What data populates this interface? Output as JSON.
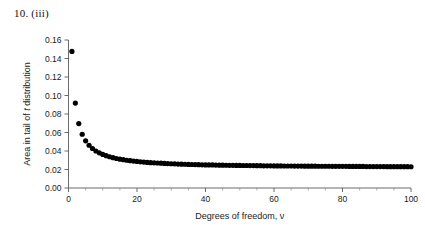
{
  "figure": {
    "label": "10. (iii)",
    "background_color": "#ffffff",
    "marker_color": "#000000",
    "axis_color": "#5a5a5a"
  },
  "chart_data": {
    "type": "scatter",
    "title": "10. (iii)",
    "xlabel_prefix": "Degrees of freedom, ",
    "xlabel_symbol": "ν",
    "xlabel": "Degrees of freedom, ν",
    "ylabel_prefix": "Area in tail of ",
    "ylabel_symbol": "t",
    "ylabel_suffix": " distribution",
    "ylabel": "Area in tail of t distribution",
    "xlim": [
      0,
      100
    ],
    "ylim": [
      0.0,
      0.16
    ],
    "x_major_ticks": [
      0,
      20,
      40,
      60,
      80,
      100
    ],
    "x_tick_labels": [
      "0",
      "20",
      "40",
      "60",
      "80",
      "100"
    ],
    "x_minor_step": 5,
    "y_major_ticks": [
      0.0,
      0.02,
      0.04,
      0.06,
      0.08,
      0.1,
      0.12,
      0.14,
      0.16
    ],
    "y_tick_labels": [
      "0.00",
      "0.02",
      "0.04",
      "0.06",
      "0.08",
      "0.10",
      "0.12",
      "0.14",
      "0.16"
    ],
    "grid": false,
    "legend": null,
    "marker": "filled-circle",
    "marker_size_px": 2.6,
    "x": [
      1,
      2,
      3,
      4,
      5,
      6,
      7,
      8,
      9,
      10,
      11,
      12,
      13,
      14,
      15,
      16,
      17,
      18,
      19,
      20,
      21,
      22,
      23,
      24,
      25,
      26,
      27,
      28,
      29,
      30,
      31,
      32,
      33,
      34,
      35,
      36,
      37,
      38,
      39,
      40,
      41,
      42,
      43,
      44,
      45,
      46,
      47,
      48,
      49,
      50,
      51,
      52,
      53,
      54,
      55,
      56,
      57,
      58,
      59,
      60,
      61,
      62,
      63,
      64,
      65,
      66,
      67,
      68,
      69,
      70,
      71,
      72,
      73,
      74,
      75,
      76,
      77,
      78,
      79,
      80,
      81,
      82,
      83,
      84,
      85,
      86,
      87,
      88,
      89,
      90,
      91,
      92,
      93,
      94,
      95,
      96,
      97,
      98,
      99,
      100
    ],
    "values": [
      0.1476,
      0.0918,
      0.0697,
      0.0581,
      0.051,
      0.0462,
      0.0427,
      0.04,
      0.038,
      0.0363,
      0.0349,
      0.0338,
      0.0328,
      0.0319,
      0.0312,
      0.0306,
      0.03,
      0.0295,
      0.0291,
      0.0287,
      0.0283,
      0.028,
      0.0277,
      0.0274,
      0.0272,
      0.027,
      0.0268,
      0.0266,
      0.0264,
      0.0262,
      0.0261,
      0.0259,
      0.0258,
      0.0257,
      0.0255,
      0.0254,
      0.0253,
      0.0252,
      0.0251,
      0.025,
      0.025,
      0.0249,
      0.0248,
      0.0247,
      0.0247,
      0.0246,
      0.0245,
      0.0245,
      0.0244,
      0.0244,
      0.0243,
      0.0243,
      0.0242,
      0.0242,
      0.0241,
      0.0241,
      0.024,
      0.024,
      0.024,
      0.0239,
      0.0239,
      0.0239,
      0.0238,
      0.0238,
      0.0238,
      0.0237,
      0.0237,
      0.0237,
      0.0236,
      0.0236,
      0.0236,
      0.0236,
      0.0235,
      0.0235,
      0.0235,
      0.0235,
      0.0234,
      0.0234,
      0.0234,
      0.0234,
      0.0234,
      0.0233,
      0.0233,
      0.0233,
      0.0233,
      0.0233,
      0.0232,
      0.0232,
      0.0232,
      0.0232,
      0.0232,
      0.0232,
      0.0231,
      0.0231,
      0.0231,
      0.0231,
      0.0231,
      0.0231,
      0.0231,
      0.023
    ]
  }
}
